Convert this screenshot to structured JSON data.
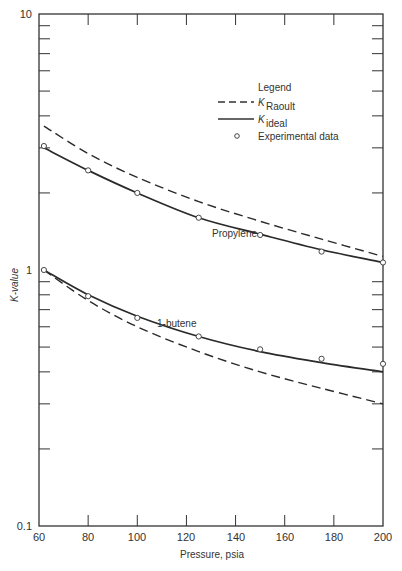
{
  "chart_data": {
    "type": "line",
    "title": "",
    "xlabel": "Pressure, psia",
    "ylabel": "K-value",
    "xlim": [
      60,
      200
    ],
    "ylim": [
      0.1,
      10
    ],
    "yscale": "log",
    "grid": false,
    "x_ticks": [
      60,
      80,
      100,
      120,
      140,
      160,
      180,
      200
    ],
    "y_tick_labels": [
      "0.1",
      "1",
      "10"
    ],
    "legend": {
      "title": "Legend",
      "position": "upper right",
      "entries": [
        {
          "style": "dashed",
          "label_main": "K",
          "label_sub": "Raoult"
        },
        {
          "style": "solid",
          "label_main": "K",
          "label_sub": "ideal"
        },
        {
          "style": "marker-circle",
          "label_main": "Experimental data",
          "label_sub": ""
        }
      ]
    },
    "series": [
      {
        "name": "Propylene K_ideal",
        "component": "Propylene",
        "style": "solid",
        "x": [
          62,
          80,
          100,
          125,
          150,
          175,
          200
        ],
        "y": [
          3.0,
          2.45,
          2.0,
          1.6,
          1.38,
          1.2,
          1.07
        ]
      },
      {
        "name": "Propylene K_Raoult",
        "component": "Propylene",
        "style": "dashed",
        "x": [
          62,
          80,
          100,
          125,
          150,
          175,
          200
        ],
        "y": [
          3.65,
          2.85,
          2.3,
          1.85,
          1.55,
          1.32,
          1.13
        ]
      },
      {
        "name": "Propylene experimental",
        "component": "Propylene",
        "style": "marker",
        "x": [
          62,
          80,
          100,
          125,
          150,
          175,
          200
        ],
        "y": [
          3.05,
          2.45,
          2.0,
          1.6,
          1.37,
          1.18,
          1.07
        ]
      },
      {
        "name": "1-butene K_ideal",
        "component": "1-butene",
        "style": "solid",
        "x": [
          62,
          80,
          100,
          125,
          150,
          175,
          200
        ],
        "y": [
          1.0,
          0.8,
          0.66,
          0.55,
          0.48,
          0.435,
          0.4
        ]
      },
      {
        "name": "1-butene K_Raoult",
        "component": "1-butene",
        "style": "dashed",
        "x": [
          62,
          80,
          100,
          125,
          150,
          175,
          200
        ],
        "y": [
          1.0,
          0.76,
          0.6,
          0.48,
          0.4,
          0.345,
          0.3
        ]
      },
      {
        "name": "1-butene experimental",
        "component": "1-butene",
        "style": "marker",
        "x": [
          62,
          80,
          100,
          125,
          150,
          175,
          200
        ],
        "y": [
          1.0,
          0.79,
          0.65,
          0.55,
          0.49,
          0.45,
          0.43
        ]
      }
    ],
    "annotations": [
      "Propylene",
      "1-butene"
    ]
  }
}
